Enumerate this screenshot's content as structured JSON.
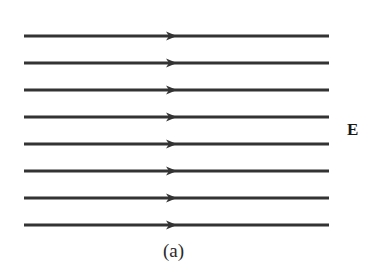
{
  "figure": {
    "field_label": "E",
    "caption": "(a)",
    "line_color": "#333333",
    "line_count": 8,
    "line_x_start": 24,
    "line_x_end": 329,
    "line_width": 3,
    "arrow_tip_x": 177,
    "line_y": [
      36,
      63,
      90,
      117,
      144,
      171,
      198,
      225
    ],
    "arrow_direction": "right"
  }
}
